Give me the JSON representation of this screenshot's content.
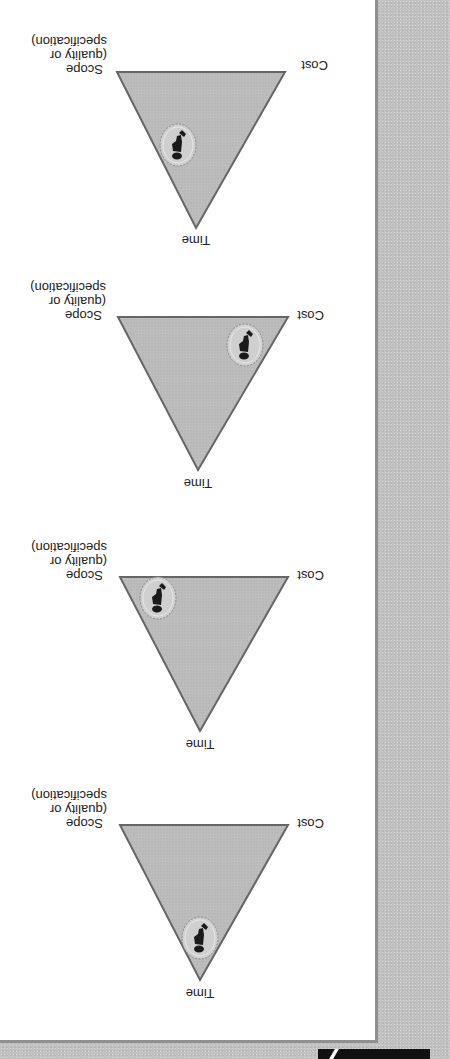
{
  "figure": {
    "orientation": "rotated 180 degrees",
    "panel_background": "#ffffff",
    "frame_background": "#c2c2c2",
    "triangle_fill": "#bdbdbd",
    "triangle_stroke": "#666666",
    "labels": {
      "time": "Time",
      "cost": "Cost",
      "scope_line1": "Scope",
      "scope_line2": "(quality or",
      "scope_line3": "specification)"
    },
    "diagrams": [
      {
        "id": "triangle-1",
        "marker_position": "near Time (balanced low)"
      },
      {
        "id": "triangle-2",
        "marker_position": "near Scope corner"
      },
      {
        "id": "triangle-3",
        "marker_position": "near Cost corner"
      },
      {
        "id": "triangle-4",
        "marker_position": "between Time and Cost"
      }
    ],
    "marker_icon": "person-in-circle-icon"
  }
}
